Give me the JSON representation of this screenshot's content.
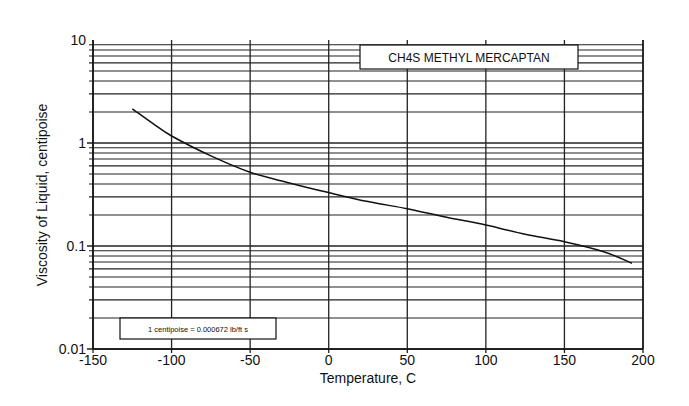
{
  "chart_data": {
    "type": "line",
    "title": "CH4S METHYL MERCAPTAN",
    "xlabel": "Temperature, C",
    "ylabel": "Viscosity of Liquid, centipoise",
    "xlim": [
      -150,
      200
    ],
    "ylim": [
      0.01,
      10
    ],
    "yscale": "log",
    "grid": true,
    "x_ticks": [
      -150,
      -100,
      -50,
      0,
      50,
      100,
      150,
      200
    ],
    "x_tick_labels": [
      "-150",
      "-100",
      "-50",
      "0",
      "50",
      "100",
      "150",
      "200"
    ],
    "y_ticks": [
      0.01,
      0.1,
      1,
      10
    ],
    "y_tick_labels": [
      "0.01",
      "0.1",
      "1",
      "10"
    ],
    "annotation": "1 centipoise = 0.000672 lb/ft s",
    "series": [
      {
        "name": "CH4S Methyl Mercaptan",
        "x": [
          -125,
          -112,
          -100,
          -75,
          -50,
          -25,
          0,
          25,
          50,
          75,
          100,
          125,
          150,
          175,
          193
        ],
        "values": [
          2.15,
          1.55,
          1.17,
          0.75,
          0.52,
          0.41,
          0.33,
          0.27,
          0.23,
          0.19,
          0.16,
          0.13,
          0.11,
          0.088,
          0.068
        ]
      }
    ]
  },
  "plot_area": {
    "left": 93,
    "right": 643,
    "top": 40,
    "bottom": 349
  },
  "colors": {
    "line": "#111111",
    "grid": "#222222",
    "background": "#ffffff"
  }
}
